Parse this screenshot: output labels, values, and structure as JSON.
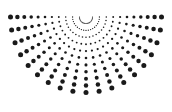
{
  "figure": {
    "background_color": "#ffffff",
    "dot_color": "#1a1a1a",
    "canvas": {
      "width": 172,
      "height": 112
    }
  },
  "chart_data": {
    "type": "scatter",
    "title": "",
    "subtitle": "",
    "xlabel": "",
    "ylabel": "",
    "xlim": [
      0,
      172
    ],
    "ylim": [
      0,
      112
    ],
    "grid": false,
    "legend": null,
    "annotations": [],
    "polar": {
      "center_x": 86,
      "center_y": 17,
      "angle_start_deg": 0,
      "angle_end_deg": 180,
      "ray_count": 19,
      "ring_count": 11,
      "radius_min": 6.5,
      "radius_step": 6.9,
      "dot_radius_min": 0.55,
      "dot_radius_max": 2.5,
      "dot_radius_gamma": 1.35
    },
    "tick_labels": {
      "x": [],
      "y": []
    },
    "series": [
      {
        "name": "radial-dots",
        "marker": "circle",
        "color": "#1a1a1a",
        "point_count": 209
      }
    ]
  }
}
